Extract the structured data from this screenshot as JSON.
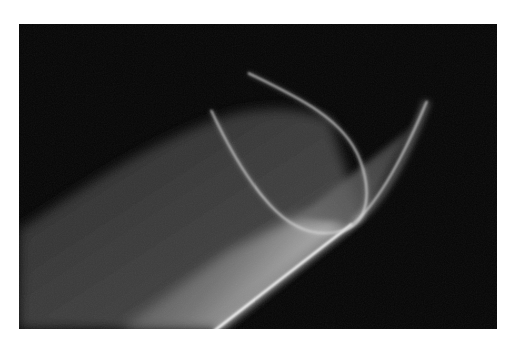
{
  "image": {
    "description": "Abstract long-exposure photograph: diffuse diagonal beam of light with a bright edge and a glowing looped curve on black",
    "background_color": "#ffffff",
    "frame_color": "#050505",
    "beam_color": "#8a8a8a",
    "highlight_color": "#ffffff",
    "curve_color": "#d8d8d8"
  }
}
